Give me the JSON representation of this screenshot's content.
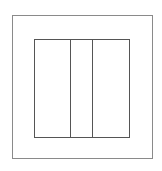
{
  "diagram": {
    "colors": {
      "background": "#ffffff",
      "outer_stroke": "#8a8a8a",
      "inner_stroke": "#555555"
    },
    "outer_box": {
      "x": 12,
      "y": 15,
      "width": 141,
      "height": 144
    },
    "inner_box": {
      "x": 34,
      "y": 39,
      "width": 96,
      "height": 99
    },
    "dividers_x": [
      70,
      92
    ],
    "sections": [
      {
        "name": "left",
        "x_from": 34,
        "x_to": 70
      },
      {
        "name": "middle",
        "x_from": 70,
        "x_to": 92
      },
      {
        "name": "right",
        "x_from": 92,
        "x_to": 130
      }
    ]
  }
}
